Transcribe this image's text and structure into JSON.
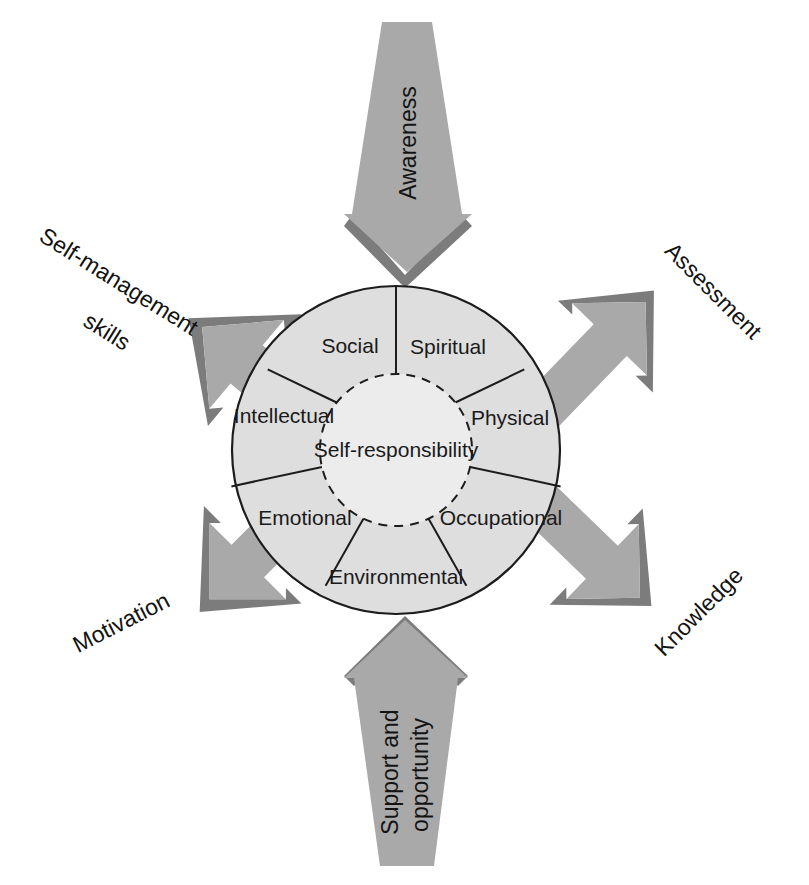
{
  "diagram": {
    "colors": {
      "background": "#ffffff",
      "ring_fill": "#dedede",
      "core_fill": "#ececec",
      "outline": "#1c1c1c",
      "arrow_face": "#a9a9a9",
      "arrow_shadow": "#7c7c7c",
      "label_text": "#1a1a1a"
    },
    "core": {
      "label": "Self-responsibility",
      "border_style": "dashed"
    },
    "ring": {
      "segment_count": 7,
      "segments": [
        {
          "label": "Spiritual",
          "center_angle_deg": 25.7,
          "name": "segment-spiritual"
        },
        {
          "label": "Physical",
          "center_angle_deg": 77.1,
          "name": "segment-physical"
        },
        {
          "label": "Occupational",
          "center_angle_deg": 128.6,
          "name": "segment-occupational"
        },
        {
          "label": "Environmental",
          "center_angle_deg": 180.0,
          "name": "segment-environmental"
        },
        {
          "label": "Emotional",
          "center_angle_deg": 231.4,
          "name": "segment-emotional"
        },
        {
          "label": "Intellectual",
          "center_angle_deg": 282.9,
          "name": "segment-intellectual"
        },
        {
          "label": "Social",
          "center_angle_deg": 334.3,
          "name": "segment-social"
        }
      ]
    },
    "arrows": [
      {
        "name": "arrow-awareness",
        "label": "Awareness",
        "lines": [
          "Awareness"
        ],
        "direction": "down",
        "position": "top"
      },
      {
        "name": "arrow-assessment",
        "label": "Assessment",
        "lines": [
          "Assessment"
        ],
        "direction": "down-left",
        "position": "upper-right"
      },
      {
        "name": "arrow-knowledge",
        "label": "Knowledge",
        "lines": [
          "Knowledge"
        ],
        "direction": "up-left",
        "position": "lower-right"
      },
      {
        "name": "arrow-support-and-opportunity",
        "label": "Support and opportunity",
        "lines": [
          "Support and",
          "opportunity"
        ],
        "direction": "up",
        "position": "bottom"
      },
      {
        "name": "arrow-motivation",
        "label": "Motivation",
        "lines": [
          "Motivation"
        ],
        "direction": "up-right",
        "position": "lower-left"
      },
      {
        "name": "arrow-self-management-skills",
        "label": "Self-management skills",
        "lines": [
          "Self-management",
          "skills"
        ],
        "direction": "down-right",
        "position": "upper-left"
      }
    ]
  }
}
